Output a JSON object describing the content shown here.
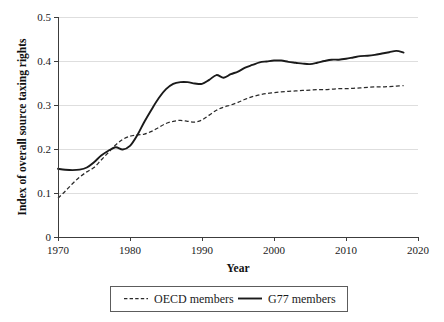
{
  "chart_data": {
    "type": "line",
    "title": "",
    "xlabel": "Year",
    "ylabel": "Index of overall source taxing rights",
    "xlim": [
      1970,
      2020
    ],
    "ylim": [
      0,
      0.5
    ],
    "grid": true,
    "legend_position": "bottom",
    "xticks": [
      "1970",
      "1980",
      "1990",
      "2000",
      "2010",
      "2020"
    ],
    "xtick_values": [
      1970,
      1980,
      1990,
      2000,
      2010,
      2020
    ],
    "yticks": [
      "0",
      "0.1",
      "0.2",
      "0.3",
      "0.4",
      "0.5"
    ],
    "ytick_values": [
      0,
      0.1,
      0.2,
      0.3,
      0.4,
      0.5
    ],
    "x": [
      1970,
      1971,
      1972,
      1973,
      1974,
      1975,
      1976,
      1977,
      1978,
      1979,
      1980,
      1981,
      1982,
      1983,
      1984,
      1985,
      1986,
      1987,
      1988,
      1989,
      1990,
      1991,
      1992,
      1993,
      1994,
      1995,
      1996,
      1997,
      1998,
      1999,
      2000,
      2001,
      2002,
      2003,
      2004,
      2005,
      2006,
      2007,
      2008,
      2009,
      2010,
      2011,
      2012,
      2013,
      2014,
      2015,
      2016,
      2017,
      2018
    ],
    "series": [
      {
        "name": "OECD members",
        "style": "dashed",
        "color": "#2a2a2a",
        "values": [
          0.088,
          0.104,
          0.121,
          0.136,
          0.148,
          0.158,
          0.175,
          0.192,
          0.209,
          0.222,
          0.229,
          0.232,
          0.234,
          0.24,
          0.249,
          0.258,
          0.263,
          0.265,
          0.263,
          0.261,
          0.266,
          0.277,
          0.288,
          0.295,
          0.3,
          0.306,
          0.313,
          0.319,
          0.323,
          0.326,
          0.328,
          0.33,
          0.331,
          0.332,
          0.333,
          0.334,
          0.335,
          0.335,
          0.336,
          0.337,
          0.337,
          0.338,
          0.339,
          0.34,
          0.341,
          0.341,
          0.342,
          0.343,
          0.344
        ]
      },
      {
        "name": "G77 members",
        "style": "solid",
        "color": "#1a1a1a",
        "values": [
          0.155,
          0.153,
          0.152,
          0.153,
          0.158,
          0.17,
          0.185,
          0.196,
          0.204,
          0.199,
          0.207,
          0.231,
          0.262,
          0.29,
          0.316,
          0.336,
          0.348,
          0.352,
          0.352,
          0.349,
          0.348,
          0.357,
          0.368,
          0.362,
          0.37,
          0.376,
          0.385,
          0.391,
          0.397,
          0.399,
          0.401,
          0.401,
          0.398,
          0.396,
          0.394,
          0.393,
          0.396,
          0.4,
          0.403,
          0.403,
          0.405,
          0.408,
          0.411,
          0.412,
          0.414,
          0.417,
          0.42,
          0.423,
          0.419
        ]
      }
    ]
  },
  "legend": {
    "entries": [
      {
        "label": "OECD members",
        "style": "dashed"
      },
      {
        "label": "G77 members",
        "style": "solid"
      }
    ]
  },
  "axes": {
    "x_title": "Year",
    "y_title": "Index of overall source taxing rights"
  }
}
